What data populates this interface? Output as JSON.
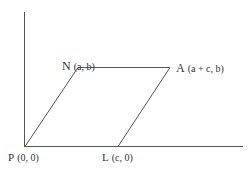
{
  "diagram": {
    "type": "parallelogram-coordinate-figure",
    "vertices": [
      {
        "name": "P",
        "coords": "(0, 0)"
      },
      {
        "name": "L",
        "coords": "(c, 0)"
      },
      {
        "name": "A",
        "coords": "(a + c, b)"
      },
      {
        "name": "N",
        "coords": "(a, b)"
      }
    ],
    "labels": {
      "P": "P",
      "P_coords": "(0, 0)",
      "L": "L",
      "L_coords": "(c, 0)",
      "A": "A",
      "A_coords": "(a + c, b)",
      "N": "N",
      "N_coords": "(a, b)"
    },
    "colors": {
      "line": "#555555",
      "text": "#333333"
    }
  }
}
